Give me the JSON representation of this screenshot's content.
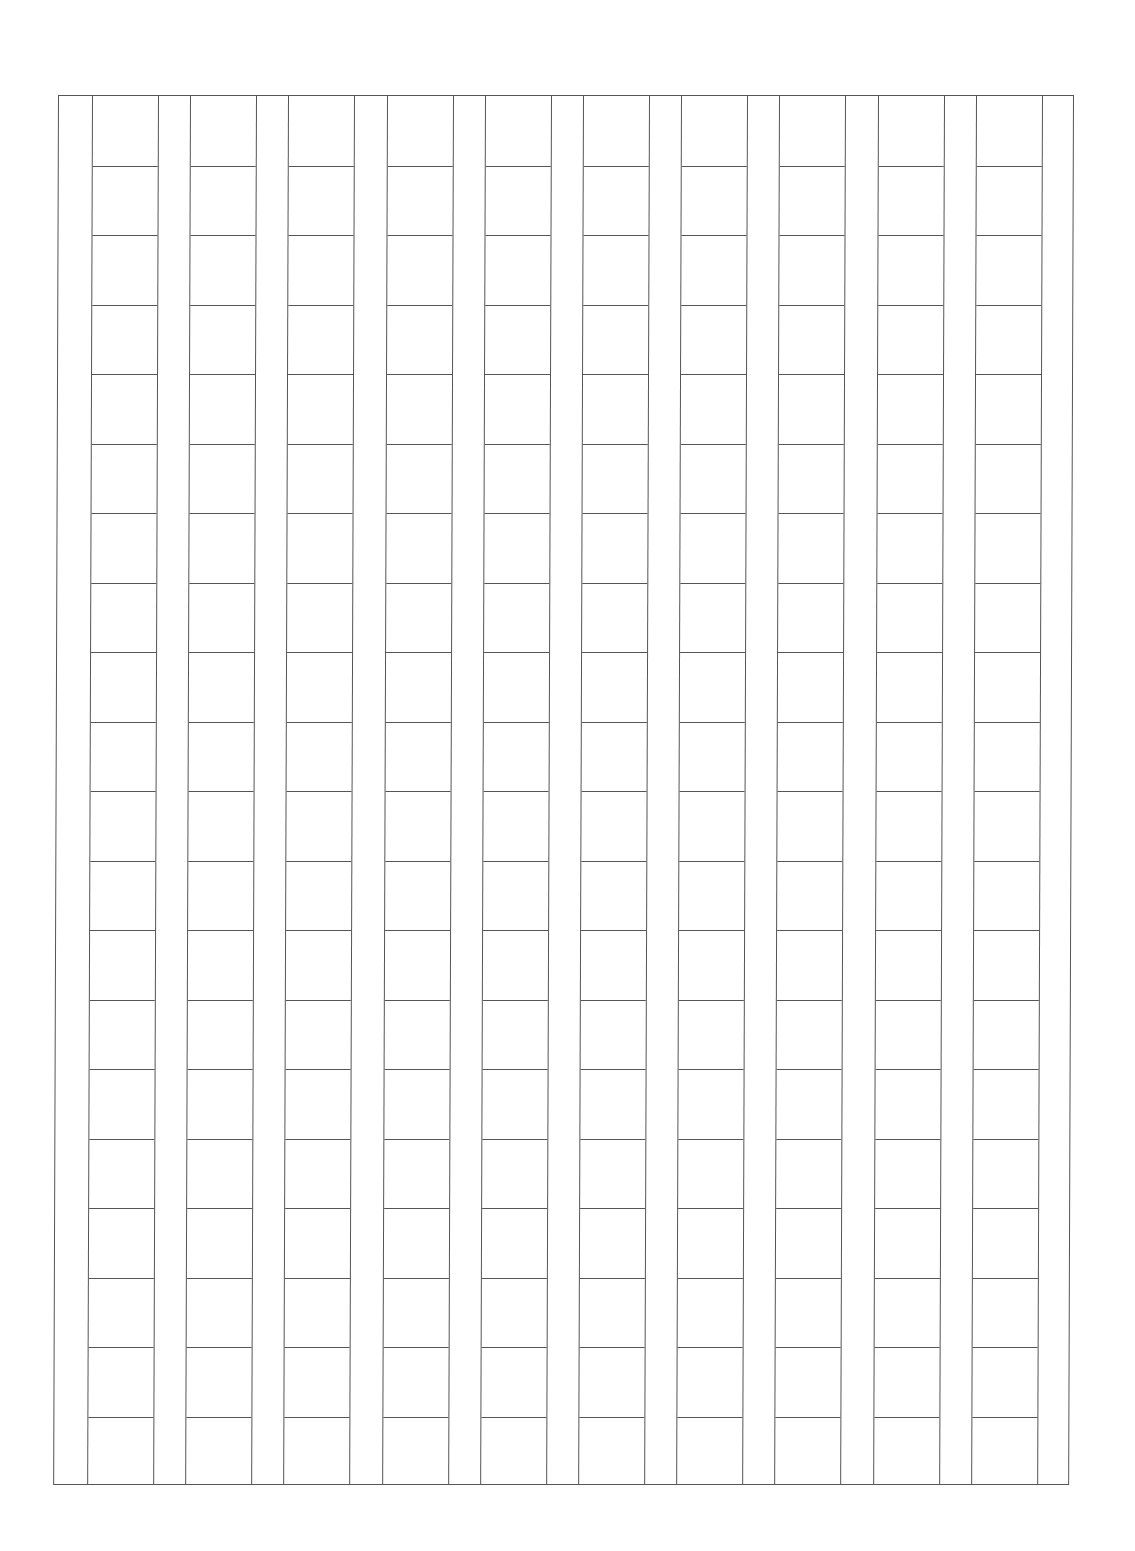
{
  "document": {
    "type": "manuscript-grid-paper",
    "frame": {
      "left": 58,
      "top": 95,
      "width": 1016,
      "height": 1390,
      "line_color": "#555555",
      "background": "#ffffff"
    },
    "grid": {
      "columns": 10,
      "rows": 20,
      "first_column_left_offset": 33,
      "column_width": 67,
      "gap_width": 31,
      "column_pitch": 98.2,
      "row_height": 69.5
    },
    "cells_text": []
  }
}
